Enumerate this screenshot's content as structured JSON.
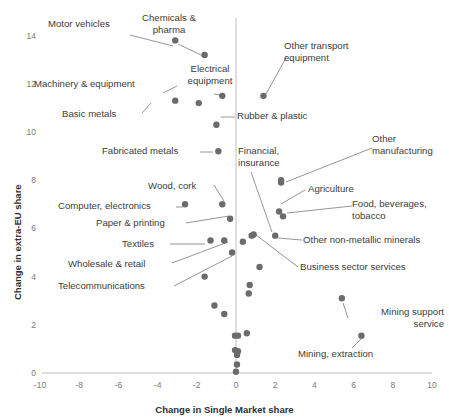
{
  "chart_data": {
    "type": "scatter",
    "title": "",
    "xlabel": "Change in Single Market share",
    "ylabel": "Change in extra-EU share",
    "xlim": [
      -10,
      10
    ],
    "ylim": [
      0,
      15
    ],
    "xticks": [
      -10,
      -8,
      -6,
      -4,
      -2,
      0,
      2,
      4,
      6,
      8,
      10
    ],
    "yticks": [
      0,
      2,
      4,
      6,
      8,
      10,
      12,
      14
    ],
    "grid": false,
    "legend": "none",
    "marker_color": "#6b6b6b",
    "axis_color": "#bfbfbf",
    "points": [
      {
        "label": "Motor vehicles",
        "x": -3.1,
        "y": 13.8
      },
      {
        "label": "Chemicals &\npharma",
        "x": -1.6,
        "y": 13.2
      },
      {
        "label": "Machinery & equipment",
        "x": -1.9,
        "y": 11.2
      },
      {
        "label": "Basic metals",
        "x": -3.1,
        "y": 11.3
      },
      {
        "label": "Electrical\nequipment",
        "x": -0.7,
        "y": 11.5
      },
      {
        "label": "Other transport\nequipment",
        "x": 1.4,
        "y": 11.5
      },
      {
        "label": "Rubber & plastic",
        "x": -1.0,
        "y": 10.3
      },
      {
        "label": "Fabricated metals",
        "x": -0.9,
        "y": 9.2
      },
      {
        "label": "Other\nmanufacturing",
        "x": 2.3,
        "y": 7.9
      },
      {
        "label": "Financial,\ninsurance",
        "x": 2.3,
        "y": 8.0
      },
      {
        "label": "Wood, cork",
        "x": -0.7,
        "y": 7.0
      },
      {
        "label": "Computer, electronics",
        "x": -2.6,
        "y": 7.0
      },
      {
        "label": "Agriculture",
        "x": 2.2,
        "y": 6.7
      },
      {
        "label": "Food, beverages,\ntobacco",
        "x": 2.4,
        "y": 6.5
      },
      {
        "label": "Paper & printing",
        "x": -0.3,
        "y": 6.4
      },
      {
        "label": "Other non-metallic minerals",
        "x": 2.0,
        "y": 5.7
      },
      {
        "label": "Textiles",
        "x": -1.3,
        "y": 5.5
      },
      {
        "label": "",
        "x": -0.6,
        "y": 5.5
      },
      {
        "label": "Business sector services",
        "x": 0.8,
        "y": 5.7
      },
      {
        "label": "",
        "x": 0.9,
        "y": 5.75
      },
      {
        "label": "",
        "x": 0.35,
        "y": 5.45
      },
      {
        "label": "Wholesale & retail",
        "x": -0.2,
        "y": 5.0
      },
      {
        "label": "",
        "x": 1.2,
        "y": 4.4
      },
      {
        "label": "Telecommunications",
        "x": -1.6,
        "y": 4.0
      },
      {
        "label": "",
        "x": 0.7,
        "y": 3.65
      },
      {
        "label": "",
        "x": 0.65,
        "y": 3.3
      },
      {
        "label": "Mining support\nservice",
        "x": 5.4,
        "y": 3.1
      },
      {
        "label": "",
        "x": -1.1,
        "y": 2.8
      },
      {
        "label": "",
        "x": -0.6,
        "y": 2.45
      },
      {
        "label": "",
        "x": 0.55,
        "y": 1.65
      },
      {
        "label": "Mining, extraction",
        "x": 6.4,
        "y": 1.55
      },
      {
        "label": "",
        "x": -0.05,
        "y": 1.55
      },
      {
        "label": "",
        "x": 0.1,
        "y": 1.55
      },
      {
        "label": "",
        "x": -0.05,
        "y": 0.95
      },
      {
        "label": "",
        "x": 0.1,
        "y": 0.9
      },
      {
        "label": "",
        "x": 0.05,
        "y": 0.75
      },
      {
        "label": "",
        "x": 0.05,
        "y": 0.35
      },
      {
        "label": "",
        "x": 0.0,
        "y": 0.05
      }
    ]
  },
  "annotations": [
    {
      "name": "motor-vehicles",
      "text": "Motor vehicles",
      "align": "l",
      "left": 48,
      "top": 18,
      "width": 110,
      "leader": [
        [
          130,
          35
        ],
        [
          173,
          46
        ]
      ]
    },
    {
      "name": "chemicals-pharma",
      "text": "Chemicals &\npharma",
      "align": "c",
      "left": 130,
      "top": 12,
      "width": 78,
      "leader": [
        [
          178,
          44
        ],
        [
          203,
          56
        ]
      ]
    },
    {
      "name": "machinery-equipment",
      "text": "Machinery & equipment",
      "align": "l",
      "left": 34,
      "top": 78,
      "width": 132,
      "leader": [
        [
          163,
          93
        ],
        [
          177,
          86
        ]
      ]
    },
    {
      "name": "basic-metals",
      "text": "Basic metals",
      "align": "l",
      "left": 62,
      "top": 108,
      "width": 76,
      "leader": [
        [
          142,
          113
        ],
        [
          151,
          103
        ]
      ]
    },
    {
      "name": "electrical-equipment",
      "text": "Electrical\nequipment",
      "align": "c",
      "left": 180,
      "top": 63,
      "width": 60,
      "leader": [
        [
          214,
          94
        ],
        [
          225,
          96
        ]
      ]
    },
    {
      "name": "other-transport-equipment",
      "text": "Other transport\nequipment",
      "align": "l",
      "left": 284,
      "top": 40,
      "width": 96,
      "leader": [
        [
          287,
          56
        ],
        [
          266,
          94
        ]
      ]
    },
    {
      "name": "rubber-plastic",
      "text": "Rubber & plastic",
      "align": "l",
      "left": 237,
      "top": 110,
      "width": 94,
      "leader": [
        [
          235,
          117
        ],
        [
          221,
          117
        ]
      ]
    },
    {
      "name": "fabricated-metals",
      "text": "Fabricated metals",
      "align": "l",
      "left": 102,
      "top": 145,
      "width": 104,
      "leader": [
        [
          200,
          152
        ],
        [
          213,
          152
        ]
      ]
    },
    {
      "name": "other-manufacturing",
      "text": "Other\nmanufacturing",
      "align": "l",
      "left": 372,
      "top": 133,
      "width": 76,
      "leader": [
        [
          372,
          148
        ],
        [
          286,
          182
        ]
      ]
    },
    {
      "name": "financial-insurance",
      "text": "Financial,\ninsurance",
      "align": "l",
      "left": 238,
      "top": 145,
      "width": 62,
      "leader": [
        [
          251,
          172
        ],
        [
          272,
          232
        ]
      ]
    },
    {
      "name": "wood-cork",
      "text": "Wood, cork",
      "align": "l",
      "left": 148,
      "top": 180,
      "width": 68,
      "leader": [
        [
          214,
          185
        ],
        [
          224,
          201
        ]
      ]
    },
    {
      "name": "computer-electronics",
      "text": "Computer, electronics",
      "align": "l",
      "left": 58,
      "top": 200,
      "width": 124,
      "leader": [
        [
          176,
          207
        ],
        [
          183,
          207
        ]
      ]
    },
    {
      "name": "agriculture",
      "text": "Agriculture",
      "align": "l",
      "left": 308,
      "top": 183,
      "width": 68,
      "leader": [
        [
          305,
          190
        ],
        [
          281,
          204
        ]
      ]
    },
    {
      "name": "food-beverages-tobacco",
      "text": "Food, beverages,\ntobacco",
      "align": "l",
      "left": 352,
      "top": 198,
      "width": 96,
      "leader": [
        [
          352,
          206
        ],
        [
          287,
          213
        ]
      ]
    },
    {
      "name": "paper-printing",
      "text": "Paper & printing",
      "align": "l",
      "left": 96,
      "top": 217,
      "width": 94,
      "leader": [
        [
          186,
          223
        ],
        [
          229,
          216
        ]
      ]
    },
    {
      "name": "other-non-metallic-minerals",
      "text": "Other non-metallic minerals",
      "align": "l",
      "left": 303,
      "top": 234,
      "width": 146,
      "leader": [
        [
          302,
          240
        ],
        [
          278,
          238
        ]
      ]
    },
    {
      "name": "textiles",
      "text": "Textiles",
      "align": "l",
      "left": 122,
      "top": 238,
      "width": 48,
      "leader": [
        [
          170,
          244
        ],
        [
          205,
          244
        ]
      ]
    },
    {
      "name": "wholesale-retail",
      "text": "Wholesale & retail",
      "align": "l",
      "left": 68,
      "top": 258,
      "width": 106,
      "leader": [
        [
          172,
          263
        ],
        [
          228,
          242
        ]
      ]
    },
    {
      "name": "business-sector-services",
      "text": "Business sector services",
      "align": "l",
      "left": 300,
      "top": 261,
      "width": 136,
      "leader": [
        [
          298,
          267
        ],
        [
          256,
          235
        ]
      ]
    },
    {
      "name": "telecommunications",
      "text": "Telecommunications",
      "align": "l",
      "left": 58,
      "top": 280,
      "width": 120,
      "leader": [
        [
          174,
          286
        ],
        [
          232,
          256
        ]
      ]
    },
    {
      "name": "mining-support-service",
      "text": "Mining support\nservice",
      "align": "r",
      "left": 340,
      "top": 306,
      "width": 104,
      "leader": [
        [
          348,
          318
        ],
        [
          343,
          303
        ]
      ]
    },
    {
      "name": "mining-extraction",
      "text": "Mining, extraction",
      "align": "l",
      "left": 298,
      "top": 348,
      "width": 104,
      "leader": [
        [
          352,
          348
        ],
        [
          364,
          336
        ]
      ]
    }
  ],
  "geometry": {
    "x0_px": 236,
    "y0_px": 373,
    "x_unit_px": 19.6,
    "y_unit_px": 24.1,
    "plot_top_px": 18,
    "plot_bottom_px": 375,
    "plot_left_px": 42,
    "plot_right_px": 432,
    "marker_radius": 3.2
  }
}
